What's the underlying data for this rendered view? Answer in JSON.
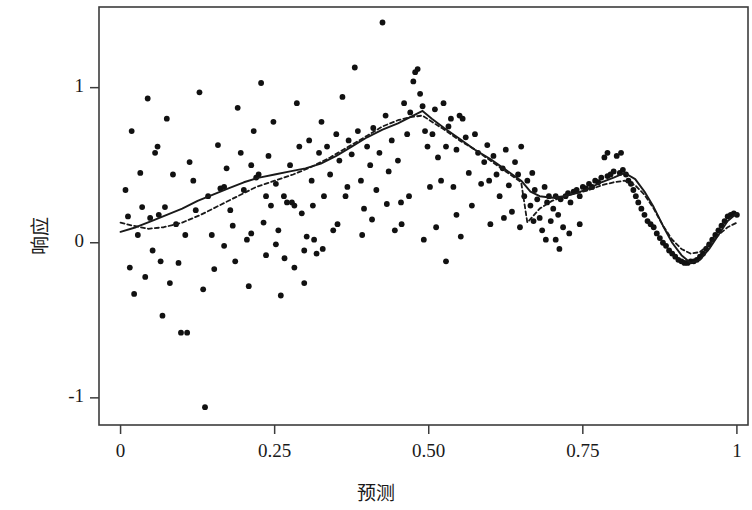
{
  "chart_data": {
    "type": "scatter",
    "title": "",
    "subtitle": "",
    "xlabel": "预测",
    "ylabel": "响应",
    "xlim": [
      -0.035,
      1.018
    ],
    "ylim": [
      -1.175,
      1.52
    ],
    "xticks": [
      0,
      0.25,
      0.5,
      0.75,
      1
    ],
    "xtick_labels": [
      "0",
      "0.25",
      "0.50",
      "0.75",
      "1"
    ],
    "yticks": [
      -1,
      0,
      1
    ],
    "ytick_labels": [
      "-1",
      "0",
      "1"
    ],
    "grid": false,
    "legend": "none",
    "frame": "box",
    "point_color": "#111111",
    "point_size": 4.2,
    "points": [
      [
        0.008,
        0.34
      ],
      [
        0.012,
        0.17
      ],
      [
        0.015,
        -0.16
      ],
      [
        0.018,
        0.72
      ],
      [
        0.022,
        -0.33
      ],
      [
        0.028,
        0.05
      ],
      [
        0.032,
        0.45
      ],
      [
        0.035,
        0.23
      ],
      [
        0.04,
        -0.22
      ],
      [
        0.044,
        0.93
      ],
      [
        0.048,
        0.16
      ],
      [
        0.052,
        -0.05
      ],
      [
        0.056,
        0.58
      ],
      [
        0.06,
        0.62
      ],
      [
        0.062,
        0.18
      ],
      [
        0.065,
        -0.12
      ],
      [
        0.068,
        -0.47
      ],
      [
        0.072,
        0.23
      ],
      [
        0.075,
        0.8
      ],
      [
        0.08,
        -0.26
      ],
      [
        0.085,
        0.44
      ],
      [
        0.09,
        0.12
      ],
      [
        0.094,
        -0.13
      ],
      [
        0.098,
        -0.58
      ],
      [
        0.105,
        0.05
      ],
      [
        0.108,
        -0.58
      ],
      [
        0.112,
        0.52
      ],
      [
        0.118,
        0.4
      ],
      [
        0.122,
        0.21
      ],
      [
        0.128,
        0.97
      ],
      [
        0.134,
        -0.3
      ],
      [
        0.137,
        -1.06
      ],
      [
        0.142,
        0.3
      ],
      [
        0.148,
        0.05
      ],
      [
        0.152,
        -0.17
      ],
      [
        0.158,
        0.63
      ],
      [
        0.162,
        0.35
      ],
      [
        0.168,
        -0.02
      ],
      [
        0.172,
        0.48
      ],
      [
        0.178,
        0.21
      ],
      [
        0.182,
        0.11
      ],
      [
        0.186,
        -0.12
      ],
      [
        0.19,
        0.87
      ],
      [
        0.195,
        0.58
      ],
      [
        0.2,
        0.34
      ],
      [
        0.205,
        0.02
      ],
      [
        0.208,
        -0.28
      ],
      [
        0.212,
        0.5
      ],
      [
        0.216,
        0.72
      ],
      [
        0.22,
        0.42
      ],
      [
        0.224,
        0.44
      ],
      [
        0.228,
        1.03
      ],
      [
        0.232,
        0.13
      ],
      [
        0.236,
        -0.08
      ],
      [
        0.24,
        0.56
      ],
      [
        0.244,
        0.24
      ],
      [
        0.248,
        0.78
      ],
      [
        0.252,
        0.38
      ],
      [
        0.256,
        0.08
      ],
      [
        0.26,
        -0.34
      ],
      [
        0.265,
        0.3
      ],
      [
        0.27,
        0.26
      ],
      [
        0.275,
        0.5
      ],
      [
        0.278,
        0.26
      ],
      [
        0.282,
        0.24
      ],
      [
        0.286,
        0.9
      ],
      [
        0.29,
        0.62
      ],
      [
        0.294,
        0.19
      ],
      [
        0.298,
        -0.05
      ],
      [
        0.302,
        0.04
      ],
      [
        0.306,
        0.66
      ],
      [
        0.31,
        0.4
      ],
      [
        0.314,
        0.02
      ],
      [
        0.318,
        -0.07
      ],
      [
        0.322,
        0.58
      ],
      [
        0.326,
        0.78
      ],
      [
        0.33,
        0.3
      ],
      [
        0.335,
        0.62
      ],
      [
        0.34,
        0.44
      ],
      [
        0.345,
        0.08
      ],
      [
        0.35,
        0.7
      ],
      [
        0.355,
        0.53
      ],
      [
        0.36,
        0.94
      ],
      [
        0.365,
        0.3
      ],
      [
        0.37,
        0.66
      ],
      [
        0.375,
        0.57
      ],
      [
        0.38,
        1.13
      ],
      [
        0.385,
        0.72
      ],
      [
        0.39,
        0.4
      ],
      [
        0.395,
        0.22
      ],
      [
        0.4,
        0.62
      ],
      [
        0.405,
        0.5
      ],
      [
        0.41,
        0.74
      ],
      [
        0.415,
        0.34
      ],
      [
        0.42,
        0.58
      ],
      [
        0.425,
        1.42
      ],
      [
        0.43,
        0.82
      ],
      [
        0.435,
        0.46
      ],
      [
        0.44,
        0.66
      ],
      [
        0.445,
        0.08
      ],
      [
        0.45,
        0.53
      ],
      [
        0.455,
        0.26
      ],
      [
        0.46,
        0.9
      ],
      [
        0.465,
        0.7
      ],
      [
        0.47,
        0.84
      ],
      [
        0.475,
        1.04
      ],
      [
        0.478,
        1.1
      ],
      [
        0.482,
        1.12
      ],
      [
        0.486,
        0.96
      ],
      [
        0.49,
        0.88
      ],
      [
        0.494,
        0.72
      ],
      [
        0.498,
        0.62
      ],
      [
        0.502,
        0.36
      ],
      [
        0.506,
        0.7
      ],
      [
        0.51,
        0.86
      ],
      [
        0.515,
        0.55
      ],
      [
        0.52,
        0.4
      ],
      [
        0.524,
        0.9
      ],
      [
        0.528,
        0.62
      ],
      [
        0.532,
        0.75
      ],
      [
        0.536,
        0.8
      ],
      [
        0.54,
        0.36
      ],
      [
        0.545,
        0.6
      ],
      [
        0.55,
        0.82
      ],
      [
        0.555,
        0.8
      ],
      [
        0.56,
        0.68
      ],
      [
        0.565,
        0.45
      ],
      [
        0.57,
        0.24
      ],
      [
        0.575,
        0.7
      ],
      [
        0.58,
        0.58
      ],
      [
        0.585,
        0.38
      ],
      [
        0.59,
        0.52
      ],
      [
        0.595,
        0.63
      ],
      [
        0.6,
        0.12
      ],
      [
        0.605,
        0.56
      ],
      [
        0.61,
        0.44
      ],
      [
        0.615,
        0.3
      ],
      [
        0.62,
        0.48
      ],
      [
        0.625,
        0.6
      ],
      [
        0.63,
        0.37
      ],
      [
        0.635,
        0.2
      ],
      [
        0.64,
        0.52
      ],
      [
        0.645,
        0.44
      ],
      [
        0.65,
        0.62
      ],
      [
        0.655,
        0.3
      ],
      [
        0.66,
        0.4
      ],
      [
        0.665,
        0.24
      ],
      [
        0.668,
        0.45
      ],
      [
        0.672,
        0.34
      ],
      [
        0.676,
        0.28
      ],
      [
        0.68,
        0.16
      ],
      [
        0.684,
        0.08
      ],
      [
        0.688,
        0.36
      ],
      [
        0.692,
        0.26
      ],
      [
        0.695,
        0.3
      ],
      [
        0.698,
        0.14
      ],
      [
        0.702,
        0.22
      ],
      [
        0.706,
        0.3
      ],
      [
        0.71,
        0.18
      ],
      [
        0.714,
        0.28
      ],
      [
        0.718,
        0.1
      ],
      [
        0.722,
        0.3
      ],
      [
        0.726,
        0.32
      ],
      [
        0.73,
        0.26
      ],
      [
        0.735,
        0.33
      ],
      [
        0.74,
        0.34
      ],
      [
        0.745,
        0.3
      ],
      [
        0.75,
        0.36
      ],
      [
        0.755,
        0.35
      ],
      [
        0.76,
        0.38
      ],
      [
        0.765,
        0.36
      ],
      [
        0.77,
        0.4
      ],
      [
        0.775,
        0.39
      ],
      [
        0.78,
        0.42
      ],
      [
        0.785,
        0.55
      ],
      [
        0.79,
        0.43
      ],
      [
        0.795,
        0.44
      ],
      [
        0.8,
        0.46
      ],
      [
        0.805,
        0.56
      ],
      [
        0.81,
        0.45
      ],
      [
        0.815,
        0.47
      ],
      [
        0.82,
        0.44
      ],
      [
        0.824,
        0.4
      ],
      [
        0.828,
        0.38
      ],
      [
        0.832,
        0.34
      ],
      [
        0.836,
        0.3
      ],
      [
        0.84,
        0.26
      ],
      [
        0.845,
        0.22
      ],
      [
        0.85,
        0.18
      ],
      [
        0.855,
        0.14
      ],
      [
        0.86,
        0.12
      ],
      [
        0.865,
        0.1
      ],
      [
        0.87,
        0.06
      ],
      [
        0.875,
        0.03
      ],
      [
        0.88,
        0.0
      ],
      [
        0.885,
        -0.02
      ],
      [
        0.89,
        -0.05
      ],
      [
        0.895,
        -0.07
      ],
      [
        0.9,
        -0.09
      ],
      [
        0.905,
        -0.11
      ],
      [
        0.91,
        -0.12
      ],
      [
        0.915,
        -0.13
      ],
      [
        0.92,
        -0.13
      ],
      [
        0.925,
        -0.12
      ],
      [
        0.93,
        -0.12
      ],
      [
        0.935,
        -0.11
      ],
      [
        0.94,
        -0.09
      ],
      [
        0.945,
        -0.07
      ],
      [
        0.95,
        -0.04
      ],
      [
        0.955,
        -0.01
      ],
      [
        0.96,
        0.02
      ],
      [
        0.965,
        0.05
      ],
      [
        0.97,
        0.08
      ],
      [
        0.975,
        0.11
      ],
      [
        0.98,
        0.14
      ],
      [
        0.985,
        0.17
      ],
      [
        0.99,
        0.18
      ],
      [
        0.995,
        0.19
      ],
      [
        1.0,
        0.18
      ],
      [
        0.545,
        0.18
      ],
      [
        0.598,
        0.4
      ],
      [
        0.622,
        0.16
      ],
      [
        0.648,
        0.1
      ],
      [
        0.67,
        0.14
      ],
      [
        0.69,
        0.02
      ],
      [
        0.706,
        0.02
      ],
      [
        0.712,
        -0.04
      ],
      [
        0.728,
        0.06
      ],
      [
        0.745,
        0.12
      ],
      [
        0.79,
        0.58
      ],
      [
        0.812,
        0.58
      ],
      [
        0.168,
        0.36
      ],
      [
        0.212,
        0.06
      ],
      [
        0.236,
        0.3
      ],
      [
        0.252,
        -0.01
      ],
      [
        0.266,
        -0.1
      ],
      [
        0.282,
        -0.16
      ],
      [
        0.298,
        -0.26
      ],
      [
        0.312,
        0.24
      ],
      [
        0.328,
        -0.04
      ],
      [
        0.352,
        0.12
      ],
      [
        0.368,
        0.36
      ],
      [
        0.392,
        0.05
      ],
      [
        0.408,
        0.15
      ],
      [
        0.432,
        0.25
      ],
      [
        0.456,
        0.12
      ],
      [
        0.468,
        0.3
      ],
      [
        0.492,
        0.02
      ],
      [
        0.512,
        0.1
      ],
      [
        0.528,
        -0.12
      ],
      [
        0.552,
        0.04
      ]
    ],
    "series": [
      {
        "name": "smooth-solid",
        "style": "solid",
        "color": "#1a1a1a",
        "width": 1.9,
        "points": [
          [
            0.0,
            0.07
          ],
          [
            0.025,
            0.1
          ],
          [
            0.05,
            0.14
          ],
          [
            0.075,
            0.18
          ],
          [
            0.1,
            0.22
          ],
          [
            0.125,
            0.27
          ],
          [
            0.15,
            0.31
          ],
          [
            0.175,
            0.35
          ],
          [
            0.2,
            0.39
          ],
          [
            0.225,
            0.42
          ],
          [
            0.25,
            0.44
          ],
          [
            0.275,
            0.46
          ],
          [
            0.3,
            0.48
          ],
          [
            0.325,
            0.51
          ],
          [
            0.35,
            0.56
          ],
          [
            0.375,
            0.62
          ],
          [
            0.4,
            0.68
          ],
          [
            0.425,
            0.73
          ],
          [
            0.45,
            0.77
          ],
          [
            0.47,
            0.81
          ],
          [
            0.49,
            0.85
          ],
          [
            0.505,
            0.8
          ],
          [
            0.525,
            0.74
          ],
          [
            0.55,
            0.67
          ],
          [
            0.575,
            0.6
          ],
          [
            0.6,
            0.54
          ],
          [
            0.625,
            0.47
          ],
          [
            0.65,
            0.4
          ],
          [
            0.665,
            0.33
          ],
          [
            0.68,
            0.3
          ],
          [
            0.7,
            0.29
          ],
          [
            0.72,
            0.3
          ],
          [
            0.74,
            0.32
          ],
          [
            0.76,
            0.35
          ],
          [
            0.78,
            0.39
          ],
          [
            0.8,
            0.42
          ],
          [
            0.818,
            0.45
          ],
          [
            0.835,
            0.41
          ],
          [
            0.85,
            0.33
          ],
          [
            0.865,
            0.23
          ],
          [
            0.88,
            0.11
          ],
          [
            0.895,
            0.0
          ],
          [
            0.91,
            -0.08
          ],
          [
            0.925,
            -0.13
          ],
          [
            0.94,
            -0.11
          ],
          [
            0.955,
            -0.04
          ],
          [
            0.97,
            0.05
          ],
          [
            0.985,
            0.14
          ],
          [
            1.0,
            0.19
          ]
        ]
      },
      {
        "name": "smooth-dashed",
        "style": "dashed",
        "color": "#1a1a1a",
        "width": 1.8,
        "dash": "4,3",
        "points": [
          [
            0.0,
            0.13
          ],
          [
            0.02,
            0.11
          ],
          [
            0.045,
            0.09
          ],
          [
            0.07,
            0.1
          ],
          [
            0.1,
            0.13
          ],
          [
            0.13,
            0.18
          ],
          [
            0.16,
            0.24
          ],
          [
            0.19,
            0.3
          ],
          [
            0.22,
            0.36
          ],
          [
            0.25,
            0.4
          ],
          [
            0.28,
            0.44
          ],
          [
            0.31,
            0.49
          ],
          [
            0.34,
            0.55
          ],
          [
            0.37,
            0.62
          ],
          [
            0.4,
            0.69
          ],
          [
            0.425,
            0.75
          ],
          [
            0.45,
            0.79
          ],
          [
            0.47,
            0.81
          ],
          [
            0.49,
            0.82
          ],
          [
            0.505,
            0.78
          ],
          [
            0.525,
            0.73
          ],
          [
            0.55,
            0.66
          ],
          [
            0.575,
            0.6
          ],
          [
            0.6,
            0.53
          ],
          [
            0.625,
            0.46
          ],
          [
            0.65,
            0.39
          ],
          [
            0.66,
            0.13
          ],
          [
            0.68,
            0.22
          ],
          [
            0.7,
            0.27
          ],
          [
            0.72,
            0.3
          ],
          [
            0.74,
            0.32
          ],
          [
            0.76,
            0.34
          ],
          [
            0.78,
            0.37
          ],
          [
            0.8,
            0.39
          ],
          [
            0.818,
            0.4
          ],
          [
            0.835,
            0.37
          ],
          [
            0.85,
            0.31
          ],
          [
            0.865,
            0.22
          ],
          [
            0.88,
            0.11
          ],
          [
            0.895,
            0.02
          ],
          [
            0.91,
            -0.04
          ],
          [
            0.925,
            -0.07
          ],
          [
            0.94,
            -0.06
          ],
          [
            0.955,
            -0.01
          ],
          [
            0.97,
            0.05
          ],
          [
            0.985,
            0.1
          ],
          [
            1.0,
            0.13
          ]
        ]
      }
    ]
  }
}
